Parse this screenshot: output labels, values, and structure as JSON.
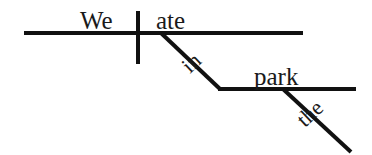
{
  "diagram": {
    "type": "reed-kellogg-sentence-diagram",
    "sentence": "We ate in the park.",
    "colors": {
      "background": "#ffffff",
      "line": "#111111",
      "text": "#1a1a1a"
    },
    "labels": {
      "subject": "We",
      "verb": "ate",
      "preposition": "in",
      "object_of_preposition": "park",
      "article": "the"
    },
    "parts": [
      {
        "word": "We",
        "role": "subject"
      },
      {
        "word": "ate",
        "role": "verb"
      },
      {
        "word": "in",
        "role": "preposition"
      },
      {
        "word": "park",
        "role": "object-of-preposition"
      },
      {
        "word": "the",
        "role": "article-modifier"
      }
    ]
  },
  "geometry": {
    "baseline_main": {
      "x1": 24,
      "y1": 33,
      "x2": 303,
      "y2": 33,
      "width": 4
    },
    "subject_verb_divider": {
      "x1": 138,
      "y1": 11,
      "x2": 138,
      "y2": 64,
      "width": 4
    },
    "preposition_slant": {
      "x1": 161,
      "y1": 33,
      "x2": 220,
      "y2": 89,
      "width": 4
    },
    "prep_object_baseline": {
      "x1": 218,
      "y1": 89,
      "x2": 356,
      "y2": 89,
      "width": 4
    },
    "article_slant": {
      "x1": 283,
      "y1": 89,
      "x2": 351,
      "y2": 152,
      "width": 4
    },
    "label_positions": {
      "we": {
        "x": 80,
        "y": 29
      },
      "ate": {
        "x": 156,
        "y": 29
      },
      "in": {
        "x": 190,
        "y": 74,
        "rotate": -43
      },
      "park": {
        "x": 254,
        "y": 85
      },
      "the": {
        "x": 305,
        "y": 128,
        "rotate": -43
      }
    }
  }
}
